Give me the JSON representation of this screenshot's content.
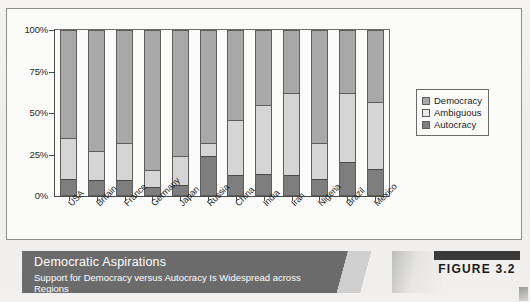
{
  "figure": {
    "tag": "FIGURE 3.2",
    "caption_title": "Democratic Aspirations",
    "caption_subtitle": "Support for Democracy versus Autocracy Is Widespread across Regions"
  },
  "legend": {
    "items": [
      {
        "label": "Democracy",
        "color": "#a8a8a8"
      },
      {
        "label": "Ambiguous",
        "color": "#e9e9e9"
      },
      {
        "label": "Autocracy",
        "color": "#7e7e7e"
      }
    ]
  },
  "axis": {
    "y_ticks": [
      "100%",
      "75%",
      "50%",
      "25%",
      "0%"
    ]
  },
  "chart_data": {
    "type": "bar",
    "stacked": true,
    "orientation": "vertical",
    "title": "Democratic Aspirations",
    "subtitle": "Support for Democracy versus Autocracy Is Widespread across Regions",
    "xlabel": "",
    "ylabel": "",
    "ylim": [
      0,
      100
    ],
    "y_ticks": [
      0,
      25,
      50,
      75,
      100
    ],
    "grid": false,
    "legend_position": "right",
    "categories": [
      "USA",
      "Britain",
      "France",
      "Germany",
      "Japan",
      "Russia",
      "China",
      "India",
      "Iran",
      "Nigeria",
      "Brazil",
      "Mexico"
    ],
    "series": [
      {
        "name": "Autocracy",
        "color": "#7e7e7e",
        "values": [
          10,
          9,
          9,
          5,
          6,
          24,
          12,
          13,
          12,
          10,
          20,
          16
        ]
      },
      {
        "name": "Ambiguous",
        "color": "#e9e9e9",
        "values": [
          25,
          18,
          23,
          10,
          18,
          8,
          34,
          42,
          50,
          22,
          42,
          41
        ]
      },
      {
        "name": "Democracy",
        "color": "#a8a8a8",
        "values": [
          65,
          73,
          68,
          85,
          76,
          68,
          54,
          45,
          38,
          68,
          38,
          43
        ]
      }
    ]
  }
}
